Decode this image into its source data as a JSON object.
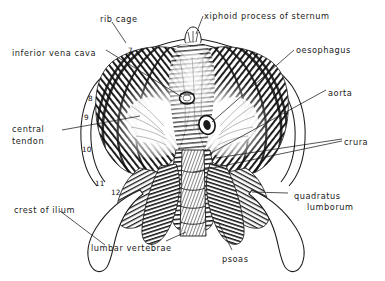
{
  "figure": {
    "background_color": "#ffffff",
    "ink_color": "#1b1b1b",
    "width": 385,
    "height": 281
  },
  "labels": [
    {
      "id": "rib-cage",
      "text": "rib cage",
      "x": 100,
      "y": 14,
      "align": "left"
    },
    {
      "id": "xiphoid-process",
      "text": "xiphoid process of sternum",
      "x": 204,
      "y": 11,
      "align": "left"
    },
    {
      "id": "inferior-vena-cava",
      "text": "inferior vena cava",
      "x": 12,
      "y": 48,
      "align": "left"
    },
    {
      "id": "oesophagus",
      "text": "oesophagus",
      "x": 296,
      "y": 45,
      "align": "left"
    },
    {
      "id": "aorta",
      "text": "aorta",
      "x": 328,
      "y": 88,
      "align": "left"
    },
    {
      "id": "crura",
      "text": "crura",
      "x": 344,
      "y": 137,
      "align": "left"
    },
    {
      "id": "central-tendon-line1",
      "text": "central",
      "x": 12,
      "y": 124,
      "align": "left"
    },
    {
      "id": "central-tendon-line2",
      "text": "tendon",
      "x": 12,
      "y": 136,
      "align": "left"
    },
    {
      "id": "quadratus-line1",
      "text": "quadratus",
      "x": 294,
      "y": 191,
      "align": "left"
    },
    {
      "id": "quadratus-line2",
      "text": "lumborum",
      "x": 307,
      "y": 202,
      "align": "left"
    },
    {
      "id": "crest-of-ilium",
      "text": "crest of ilium",
      "x": 14,
      "y": 205,
      "align": "left"
    },
    {
      "id": "lumbar-vertebrae",
      "text": "lumbar vertebrae",
      "x": 91,
      "y": 243,
      "align": "left"
    },
    {
      "id": "psoas",
      "text": "psoas",
      "x": 222,
      "y": 254,
      "align": "left"
    }
  ],
  "rib_numbers": [
    {
      "id": "rib-7",
      "text": "7",
      "x": 128,
      "y": 46
    },
    {
      "id": "rib-8",
      "text": "8",
      "x": 88,
      "y": 94
    },
    {
      "id": "rib-9",
      "text": "9",
      "x": 84,
      "y": 113
    },
    {
      "id": "rib-10",
      "text": "10",
      "x": 82,
      "y": 145
    },
    {
      "id": "rib-11",
      "text": "11",
      "x": 95,
      "y": 179
    },
    {
      "id": "rib-12",
      "text": "12",
      "x": 111,
      "y": 188
    }
  ],
  "structures": [
    {
      "id": "diaphragm-dome",
      "name": "diaphragm muscle dome"
    },
    {
      "id": "central-tendon-area",
      "name": "central tendon"
    },
    {
      "id": "rib-cage-outline",
      "name": "rib cage outline"
    },
    {
      "id": "xiphoid-notch",
      "name": "xiphoid process"
    },
    {
      "id": "caval-opening",
      "name": "inferior vena cava opening"
    },
    {
      "id": "oesophageal-hiatus",
      "name": "oesophageal hiatus"
    },
    {
      "id": "aortic-hiatus",
      "name": "aortic hiatus"
    },
    {
      "id": "left-crus",
      "name": "left crus"
    },
    {
      "id": "right-crus",
      "name": "right crus"
    },
    {
      "id": "lumbar-vertebral-col",
      "name": "lumbar vertebral column"
    },
    {
      "id": "psoas-left",
      "name": "psoas major (left)"
    },
    {
      "id": "psoas-right",
      "name": "psoas major (right)"
    },
    {
      "id": "quadratus-left",
      "name": "quadratus lumborum (left)"
    },
    {
      "id": "quadratus-right",
      "name": "quadratus lumborum (right)"
    },
    {
      "id": "ilium-left",
      "name": "crest of ilium (left)"
    },
    {
      "id": "ilium-right",
      "name": "crest of ilium (right)"
    }
  ]
}
